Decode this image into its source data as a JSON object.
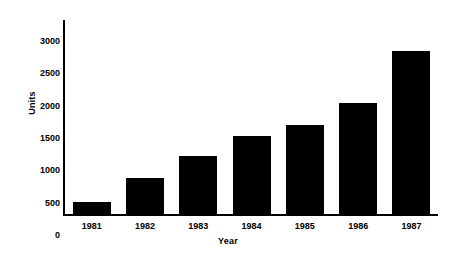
{
  "chart_data": {
    "type": "bar",
    "title": "",
    "subtitle": "",
    "xlabel": "Year",
    "ylabel": "Units",
    "categories": [
      "1981",
      "1982",
      "1983",
      "1984",
      "1985",
      "1986",
      "1987"
    ],
    "values": [
      180,
      560,
      900,
      1200,
      1370,
      1720,
      2520
    ],
    "series": [
      {
        "name": "Units",
        "values": [
          180,
          560,
          900,
          1200,
          1370,
          1720,
          2520
        ]
      }
    ],
    "ylim": [
      0,
      3000
    ],
    "yticks": [
      0,
      500,
      1000,
      1500,
      2000,
      2500,
      3000
    ],
    "ytick_labels": [
      "0",
      "500",
      "1000",
      "1500",
      "2000",
      "2500",
      "3000"
    ],
    "xtick_labels": [
      "1981",
      "1982",
      "1983",
      "1984",
      "1985",
      "1986",
      "1987"
    ],
    "grid": false,
    "legend": false,
    "legend_position": "none",
    "bar_color": "#000000",
    "axis_color": "#000000",
    "background_color": "#ffffff",
    "annotations": []
  }
}
